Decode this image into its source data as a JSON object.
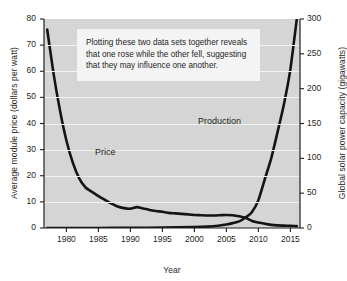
{
  "chart_data": {
    "type": "line",
    "title": "",
    "subtitle": "",
    "xlabel": "Year",
    "ylabel": "Average module price (dollars per watt)",
    "ylabel_secondary": "Global solar power capacity (gigawatts)",
    "xlim": [
      1976.5,
      2016.5
    ],
    "ylim": [
      0,
      80
    ],
    "ylim_secondary": [
      0,
      300
    ],
    "grid": "horizontal-white",
    "legend": "inline-labels",
    "xticks": [
      1980,
      1985,
      1990,
      1995,
      2000,
      2005,
      2010,
      2015
    ],
    "xtick_labels": [
      "1980",
      "1985",
      "1990",
      "1995",
      "2000",
      "2005",
      "2010",
      "2015"
    ],
    "yticks": [
      0,
      10,
      20,
      30,
      40,
      50,
      60,
      70,
      80
    ],
    "ytick_labels": [
      "0",
      "10",
      "20",
      "30",
      "40",
      "50",
      "60",
      "70",
      "80"
    ],
    "yticks_secondary": [
      0,
      50,
      100,
      150,
      200,
      250,
      300
    ],
    "ytick_labels_secondary": [
      "0",
      "50",
      "100",
      "150",
      "200",
      "250",
      "300"
    ],
    "annotation": "Plotting these two data sets together reveals that one rose while the other fell, suggesting that they may influence one another.",
    "series": [
      {
        "name": "Price",
        "label": "Price",
        "axis": "left",
        "units": "dollars per watt",
        "color": "#141414",
        "x": [
          1977,
          1978,
          1979,
          1980,
          1981,
          1982,
          1983,
          1984,
          1985,
          1986,
          1987,
          1988,
          1989,
          1990,
          1991,
          1992,
          1993,
          1994,
          1995,
          1996,
          1997,
          1998,
          1999,
          2000,
          2001,
          2002,
          2003,
          2004,
          2005,
          2006,
          2007,
          2008,
          2009,
          2010,
          2011,
          2012,
          2013,
          2014,
          2015,
          2016
        ],
        "values": [
          76.0,
          59.0,
          45.0,
          33.5,
          25.0,
          19.0,
          15.5,
          13.8,
          12.2,
          10.8,
          9.4,
          8.2,
          7.6,
          7.4,
          8.0,
          7.5,
          6.9,
          6.5,
          6.2,
          5.8,
          5.6,
          5.4,
          5.2,
          5.0,
          4.9,
          4.8,
          4.8,
          4.9,
          5.0,
          4.9,
          4.5,
          3.9,
          2.7,
          2.1,
          1.6,
          1.2,
          1.0,
          0.9,
          0.8,
          0.7
        ]
      },
      {
        "name": "Production",
        "label": "Production",
        "axis": "right",
        "units": "gigawatts",
        "color": "#141414",
        "x": [
          1977,
          1980,
          1985,
          1990,
          1995,
          2000,
          2002,
          2004,
          2005,
          2006,
          2007,
          2008,
          2009,
          2010,
          2011,
          2012,
          2013,
          2014,
          2015,
          2016
        ],
        "values": [
          0.0,
          0.0,
          0.1,
          0.2,
          0.5,
          1.3,
          2.0,
          3.7,
          5.1,
          7.0,
          9.5,
          15.0,
          23.0,
          40.0,
          70.0,
          100.0,
          138.0,
          178.0,
          228.0,
          300.0
        ]
      }
    ]
  },
  "labels": {
    "price": "Price",
    "production": "Production"
  }
}
